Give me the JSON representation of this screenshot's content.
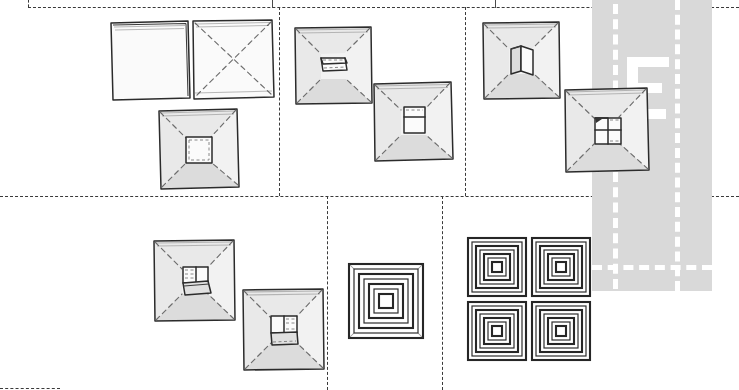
{
  "canvas": {
    "width": 739,
    "height": 390,
    "background": "#ffffff"
  },
  "grid": {
    "name": "storyboard-grid",
    "line_color": "#3a3a3a",
    "style": "dashed",
    "horizontal_lines": [
      {
        "id": "grid-h-top",
        "y": 7,
        "x": 28,
        "w": 711
      },
      {
        "id": "grid-h-middle",
        "y": 196,
        "x": 0,
        "w": 739
      },
      {
        "id": "grid-h-bottom",
        "y": 388,
        "x": 0,
        "w": 60
      }
    ],
    "vertical_lines": [
      {
        "id": "grid-v-left",
        "x": 28,
        "y": 0,
        "h": 7
      },
      {
        "id": "grid-v-row1-a",
        "x": 279,
        "y": 7,
        "h": 189
      },
      {
        "id": "grid-v-row1-b",
        "x": 465,
        "y": 7,
        "h": 189
      },
      {
        "id": "grid-v-row2-a",
        "x": 327,
        "y": 196,
        "h": 194
      },
      {
        "id": "grid-v-row2-b",
        "x": 442,
        "y": 196,
        "h": 194
      }
    ],
    "ticks": [
      {
        "id": "grid-tick-a",
        "x": 272,
        "y": 0,
        "h": 8
      },
      {
        "id": "grid-tick-b",
        "x": 495,
        "y": 0,
        "h": 8
      }
    ]
  },
  "overlay": {
    "name": "gray-road-overlay",
    "color": "#d9d9d9",
    "x": 592,
    "y": 0,
    "width": 120,
    "height": 291,
    "white_marking_color": "#ffffff",
    "lane_lines_vertical": [
      {
        "id": "lane-v-1",
        "x": 613,
        "y": 4,
        "h": 285
      },
      {
        "id": "lane-v-2",
        "x": 675,
        "y": 0,
        "h": 291
      }
    ],
    "lane_lines_horizontal": [
      {
        "id": "lane-h-1",
        "y": 265,
        "x": 592,
        "w": 120
      }
    ],
    "glyph": {
      "id": "white-e-glyph",
      "label": "E",
      "x": 627,
      "y": 57,
      "width": 42,
      "height": 62
    }
  },
  "cells": [
    {
      "id": "cell-r1c1",
      "row": 1,
      "col": 1,
      "figure_ids": [
        "flat-square-blank",
        "flat-square-diagonals",
        "pyramid-open-center"
      ]
    },
    {
      "id": "cell-r1c2",
      "row": 1,
      "col": 2,
      "figure_ids": [
        "pyramid-tab-flat-a",
        "pyramid-tab-upright-a"
      ]
    },
    {
      "id": "cell-r1c3",
      "row": 1,
      "col": 3,
      "figure_ids": [
        "pyramid-tab-upright-b",
        "pyramid-tab-folded-b"
      ]
    },
    {
      "id": "cell-r2c1",
      "row": 2,
      "col": 1,
      "figure_ids": [
        "pyramid-tab-folded-c",
        "pyramid-tab-folded-d"
      ]
    },
    {
      "id": "cell-r2c2",
      "row": 2,
      "col": 2,
      "figure_ids": [
        "spiral-single"
      ]
    },
    {
      "id": "cell-r2c3",
      "row": 2,
      "col": 3,
      "figure_ids": [
        "spiral-quad"
      ]
    }
  ],
  "figures": {
    "flat-square-blank": {
      "name": "flat-square-blank",
      "x": 108,
      "y": 18,
      "w": 82,
      "h": 82,
      "kind": "square",
      "creases": "none"
    },
    "flat-square-diagonals": {
      "name": "flat-square-diagonals",
      "x": 190,
      "y": 17,
      "w": 84,
      "h": 82,
      "kind": "square",
      "creases": "x-diagonals"
    },
    "pyramid-open-center": {
      "name": "pyramid-open-center",
      "x": 155,
      "y": 105,
      "w": 82,
      "h": 82,
      "kind": "pyramid",
      "center": "open-square"
    },
    "pyramid-tab-flat-a": {
      "name": "pyramid-tab-flat-a",
      "x": 292,
      "y": 24,
      "w": 80,
      "h": 80,
      "kind": "pyramid",
      "center": "tab-flat"
    },
    "pyramid-tab-upright-a": {
      "name": "pyramid-tab-upright-a",
      "x": 371,
      "y": 79,
      "w": 82,
      "h": 82,
      "kind": "pyramid",
      "center": "tab-upright"
    },
    "pyramid-tab-upright-b": {
      "name": "pyramid-tab-upright-b",
      "x": 480,
      "y": 19,
      "w": 80,
      "h": 80,
      "kind": "pyramid",
      "center": "tab-upright-open"
    },
    "pyramid-tab-folded-b": {
      "name": "pyramid-tab-folded-b",
      "x": 562,
      "y": 85,
      "w": 86,
      "h": 86,
      "kind": "pyramid",
      "center": "tab-folded"
    },
    "pyramid-tab-folded-c": {
      "name": "pyramid-tab-folded-c",
      "x": 151,
      "y": 237,
      "w": 84,
      "h": 84,
      "kind": "pyramid",
      "center": "tab-folded-down"
    },
    "pyramid-tab-folded-d": {
      "name": "pyramid-tab-folded-d",
      "x": 240,
      "y": 286,
      "w": 84,
      "h": 84,
      "kind": "pyramid",
      "center": "tab-folded-down"
    },
    "spiral-single": {
      "name": "spiral-single",
      "x": 346,
      "y": 261,
      "w": 78,
      "h": 78,
      "kind": "concentric-square",
      "rings": 4
    },
    "spiral-quad": {
      "name": "spiral-quad",
      "x": 465,
      "y": 235,
      "w": 124,
      "h": 124,
      "kind": "concentric-square-2x2",
      "rings": 4
    }
  },
  "legend": {
    "description": "Hand-drawn storyboard of square folding stages arranged in a dashed 2x3 grid, with a gray road-like overlay panel at right."
  }
}
